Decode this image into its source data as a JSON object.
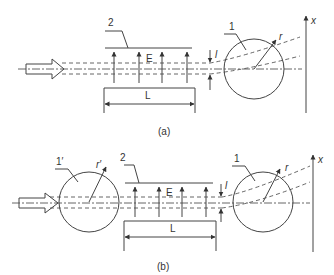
{
  "figure": {
    "panels": [
      {
        "id": "a",
        "caption": "(a)",
        "labels": {
          "deflector": "1",
          "plates": "2",
          "field": "E",
          "length": "L",
          "offset": "l",
          "radius": "r",
          "screen_axis": "x"
        }
      },
      {
        "id": "b",
        "caption": "(b)",
        "labels": {
          "lens": "1′",
          "lens_radius": "r′",
          "deflector": "1",
          "plates": "2",
          "field": "E",
          "length": "L",
          "offset": "l",
          "radius": "r",
          "screen_axis": "x"
        }
      }
    ]
  }
}
